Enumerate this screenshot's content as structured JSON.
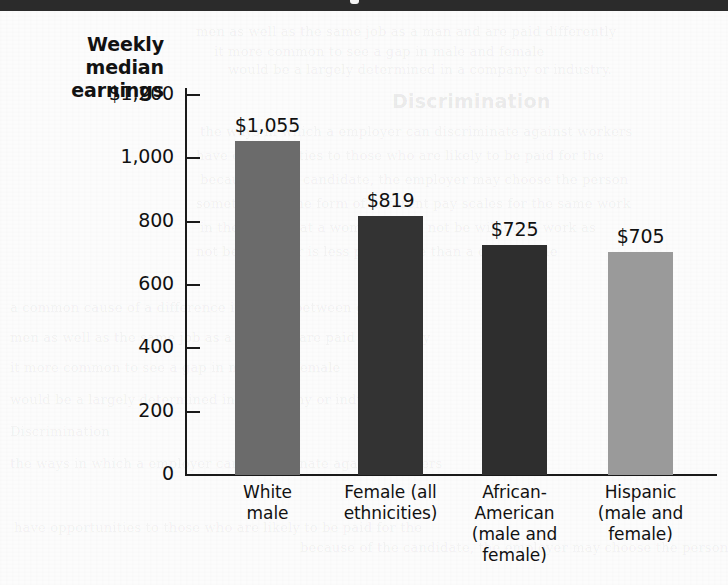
{
  "page": {
    "background_color": "#fcfcfc",
    "header_band_color": "#2b2b2b",
    "bleed_through_lines": [
      "men as well as the same job as a man and are paid differently",
      "it more common to see a gap in male and female",
      "would be a largely determined in a company or industry.",
      "Discrimination",
      "the ways in which a employer can discriminate against workers",
      "have opportunities to those who are likely to be paid for the",
      "because of the candidate, the employer may choose the person",
      "sometimes in the form of different pay scales for the same work",
      "in the belief that a woman would not be willing to work as",
      "not be a worker is less productive than a comparable",
      "a common cause of a difference in wages between groups"
    ]
  },
  "chart_data": {
    "type": "bar",
    "title": "",
    "ylabel": "Weekly median earnings",
    "xlabel": "",
    "ylim": [
      0,
      1200
    ],
    "grid": false,
    "legend": "none",
    "ytick_labels": [
      "$1,200",
      "1,000",
      "800",
      "600",
      "400",
      "200",
      "0"
    ],
    "ytick_values": [
      1200,
      1000,
      800,
      600,
      400,
      200,
      0
    ],
    "categories": [
      "White\nmale",
      "Female (all\nethnicities)",
      "African-\nAmerican\n(male and\nfemale)",
      "Hispanic\n(male and\nfemale)"
    ],
    "values": [
      1055,
      819,
      725,
      705
    ],
    "value_labels": [
      "$1,055",
      "$819",
      "$725",
      "$705"
    ],
    "bar_colors": [
      "#6b6b6b",
      "#333333",
      "#2e2e2e",
      "#9a9a9a"
    ]
  },
  "axis_title": {
    "line1": "Weekly",
    "line2": "median",
    "line3": "earnings"
  },
  "ticks": [
    {
      "label": "$1,200",
      "value": 1200
    },
    {
      "label": "1,000",
      "value": 1000
    },
    {
      "label": "800",
      "value": 800
    },
    {
      "label": "600",
      "value": 600
    },
    {
      "label": "400",
      "value": 400
    },
    {
      "label": "200",
      "value": 200
    },
    {
      "label": "0",
      "value": 0
    }
  ],
  "bars": [
    {
      "value_label": "$1,055",
      "value": 1055,
      "color": "#6b6b6b",
      "category_lines": [
        "White",
        "male"
      ]
    },
    {
      "value_label": "$819",
      "value": 819,
      "color": "#333333",
      "category_lines": [
        "Female (all",
        "ethnicities)"
      ]
    },
    {
      "value_label": "$725",
      "value": 725,
      "color": "#2e2e2e",
      "category_lines": [
        "African-",
        "American",
        "(male and",
        "female)"
      ]
    },
    {
      "value_label": "$705",
      "value": 705,
      "color": "#9a9a9a",
      "category_lines": [
        "Hispanic",
        "(male and",
        "female)"
      ]
    }
  ]
}
